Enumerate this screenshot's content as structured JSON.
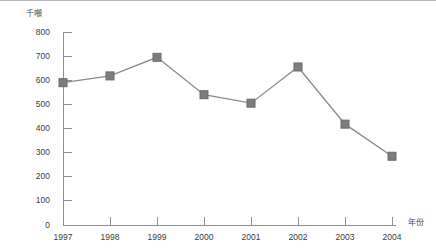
{
  "chart_data": {
    "type": "line",
    "title": "",
    "subtitle": "",
    "xlabel": "年份",
    "ylabel": "千噸",
    "categories": [
      "1997",
      "1998",
      "1999",
      "2000",
      "2001",
      "2002",
      "2003",
      "2004"
    ],
    "values": [
      590,
      618,
      695,
      540,
      505,
      655,
      418,
      285
    ],
    "series": [
      {
        "name": "",
        "values": [
          590,
          618,
          695,
          540,
          505,
          655,
          418,
          285
        ]
      }
    ],
    "ylim": [
      0,
      800
    ],
    "yticks": [
      0,
      100,
      200,
      300,
      400,
      500,
      600,
      700,
      800
    ],
    "ytick_labels": [
      "0",
      "100",
      "200",
      "300",
      "400",
      "500",
      "600",
      "700",
      "800"
    ],
    "xtick_labels": [
      "1997",
      "1998",
      "1999",
      "2000",
      "2001",
      "2002",
      "2003",
      "2004"
    ],
    "grid": false,
    "legend": null,
    "marker": "square",
    "colors": {
      "line": "#8a8a8a",
      "marker": "#7d7d7d",
      "marker_edge": "#6a6a6a",
      "axis": "#8f8f8f",
      "text": "#3c3c3c"
    }
  },
  "axes": {
    "y_title": "千噸",
    "x_title": "年份"
  }
}
